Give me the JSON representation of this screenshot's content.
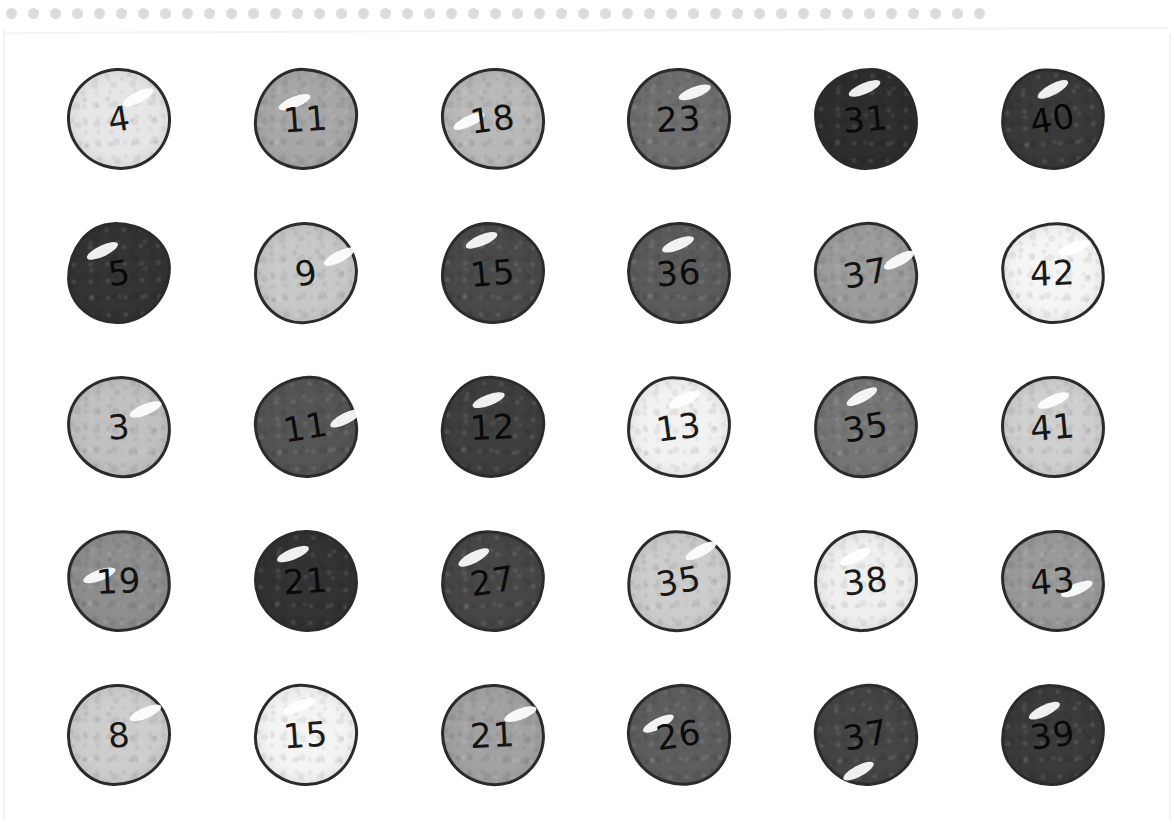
{
  "page": {
    "background_color": "#ffffff",
    "border_dot_color": "#dcdcdc",
    "border_dot_count": 45,
    "ink_color": "#2b2b2b"
  },
  "chart_data": {
    "type": "table",
    "rows": 5,
    "columns": 6,
    "values": [
      [
        4,
        11,
        18,
        23,
        31,
        40
      ],
      [
        5,
        9,
        15,
        36,
        37,
        42
      ],
      [
        3,
        11,
        12,
        13,
        35,
        41
      ],
      [
        19,
        21,
        27,
        35,
        38,
        43
      ],
      [
        8,
        15,
        21,
        26,
        37,
        39
      ]
    ]
  },
  "counters": [
    {
      "value": "4",
      "fill": "#e6e6e6",
      "text": "#1c1c1c",
      "shine": true,
      "shine_x": 52,
      "shine_y": 22,
      "shape": "sv1",
      "rot": "rot1"
    },
    {
      "value": "11",
      "fill": "#a7a7a7",
      "text": "#161616",
      "shine": true,
      "shine_x": 20,
      "shine_y": 26,
      "shape": "sv2",
      "rot": "rot2"
    },
    {
      "value": "18",
      "fill": "#b9b9b9",
      "text": "#131313",
      "shine": true,
      "shine_x": 8,
      "shine_y": 44,
      "shape": "sv3",
      "rot": "rot3"
    },
    {
      "value": "23",
      "fill": "#6f6f6f",
      "text": "#0d0d0d",
      "shine": true,
      "shine_x": 46,
      "shine_y": 15,
      "shape": "sv4",
      "rot": "rot4"
    },
    {
      "value": "31",
      "fill": "#2e2e2e",
      "text": "#0a0a0a",
      "shine": true,
      "shine_x": 30,
      "shine_y": 12,
      "shape": "sv5",
      "rot": "rot5"
    },
    {
      "value": "40",
      "fill": "#3a3a3a",
      "text": "#060606",
      "shine": true,
      "shine_x": 34,
      "shine_y": 13,
      "shape": "sv6",
      "rot": "rot6"
    },
    {
      "value": "5",
      "fill": "#343434",
      "text": "#090909",
      "shine": true,
      "shine_x": 16,
      "shine_y": 20,
      "shape": "sv2",
      "rot": "rot3"
    },
    {
      "value": "9",
      "fill": "#c8c8c8",
      "text": "#151515",
      "shine": true,
      "shine_x": 66,
      "shine_y": 28,
      "shape": "sv4",
      "rot": "rot1"
    },
    {
      "value": "15",
      "fill": "#4a4a4a",
      "text": "#0b0b0b",
      "shine": true,
      "shine_x": 20,
      "shine_y": 10,
      "shape": "sv6",
      "rot": "rot5"
    },
    {
      "value": "36",
      "fill": "#5c5c5c",
      "text": "#0c0c0c",
      "shine": true,
      "shine_x": 30,
      "shine_y": 14,
      "shape": "sv1",
      "rot": "rot2"
    },
    {
      "value": "37",
      "fill": "#9c9c9c",
      "text": "#141414",
      "shine": true,
      "shine_x": 66,
      "shine_y": 32,
      "shape": "sv3",
      "rot": "rot6"
    },
    {
      "value": "42",
      "fill": "#f5f5f5",
      "text": "#1a1a1a",
      "shine": true,
      "shine_x": 52,
      "shine_y": 16,
      "shape": "sv5",
      "rot": "rot4"
    },
    {
      "value": "3",
      "fill": "#c0c0c0",
      "text": "#161616",
      "shine": true,
      "shine_x": 58,
      "shine_y": 24,
      "shape": "sv3",
      "rot": "rot2"
    },
    {
      "value": "11",
      "fill": "#555555",
      "text": "#0c0c0c",
      "shine": true,
      "shine_x": 72,
      "shine_y": 36,
      "shape": "sv5",
      "rot": "rot1"
    },
    {
      "value": "12",
      "fill": "#3f3f3f",
      "text": "#0a0a0a",
      "shine": true,
      "shine_x": 26,
      "shine_y": 16,
      "shape": "sv2",
      "rot": "rot4"
    },
    {
      "value": "13",
      "fill": "#f2f2f2",
      "text": "#1b1b1b",
      "shine": true,
      "shine_x": 38,
      "shine_y": 15,
      "shape": "sv6",
      "rot": "rot3"
    },
    {
      "value": "35",
      "fill": "#767676",
      "text": "#0e0e0e",
      "shine": true,
      "shine_x": 30,
      "shine_y": 12,
      "shape": "sv4",
      "rot": "rot6"
    },
    {
      "value": "41",
      "fill": "#cfcfcf",
      "text": "#171717",
      "shine": true,
      "shine_x": 32,
      "shine_y": 16,
      "shape": "sv1",
      "rot": "rot5"
    },
    {
      "value": "19",
      "fill": "#8e8e8e",
      "text": "#131313",
      "shine": true,
      "shine_x": 12,
      "shine_y": 38,
      "shape": "sv5",
      "rot": "rot4"
    },
    {
      "value": "21",
      "fill": "#333333",
      "text": "#090909",
      "shine": true,
      "shine_x": 18,
      "shine_y": 16,
      "shape": "sv1",
      "rot": "rot2"
    },
    {
      "value": "27",
      "fill": "#474747",
      "text": "#0a0a0a",
      "shine": true,
      "shine_x": 14,
      "shine_y": 18,
      "shape": "sv6",
      "rot": "rot1"
    },
    {
      "value": "35",
      "fill": "#cccccc",
      "text": "#171717",
      "shine": true,
      "shine_x": 56,
      "shine_y": 14,
      "shape": "sv2",
      "rot": "rot6"
    },
    {
      "value": "38",
      "fill": "#efefef",
      "text": "#1a1a1a",
      "shine": true,
      "shine_x": 22,
      "shine_y": 18,
      "shape": "sv4",
      "rot": "rot3"
    },
    {
      "value": "43",
      "fill": "#9a9a9a",
      "text": "#121212",
      "shine": true,
      "shine_x": 56,
      "shine_y": 50,
      "shape": "sv3",
      "rot": "rot5"
    },
    {
      "value": "8",
      "fill": "#cdcdcd",
      "text": "#171717",
      "shine": true,
      "shine_x": 58,
      "shine_y": 20,
      "shape": "sv4",
      "rot": "rot5"
    },
    {
      "value": "15",
      "fill": "#f4f4f4",
      "text": "#1b1b1b",
      "shine": true,
      "shine_x": 24,
      "shine_y": 14,
      "shape": "sv6",
      "rot": "rot2"
    },
    {
      "value": "21",
      "fill": "#a2a2a2",
      "text": "#141414",
      "shine": true,
      "shine_x": 58,
      "shine_y": 20,
      "shape": "sv1",
      "rot": "rot4"
    },
    {
      "value": "26",
      "fill": "#5e5e5e",
      "text": "#0c0c0c",
      "shine": true,
      "shine_x": 12,
      "shine_y": 30,
      "shape": "sv3",
      "rot": "rot1"
    },
    {
      "value": "37",
      "fill": "#454545",
      "text": "#0a0a0a",
      "shine": true,
      "shine_x": 22,
      "shine_y": 78,
      "shape": "sv5",
      "rot": "rot6"
    },
    {
      "value": "39",
      "fill": "#3b3b3b",
      "text": "#090909",
      "shine": true,
      "shine_x": 24,
      "shine_y": 18,
      "shape": "sv2",
      "rot": "rot3"
    }
  ]
}
